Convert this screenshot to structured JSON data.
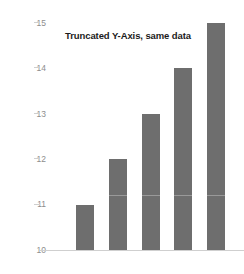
{
  "chart_data": {
    "type": "bar",
    "title": "Truncated Y-Axis, same data",
    "xlabel": "",
    "ylabel": "",
    "categories": [
      "1",
      "2",
      "3",
      "4",
      "5"
    ],
    "values": [
      11,
      12,
      13,
      14,
      15
    ],
    "ylim": [
      10,
      15
    ],
    "yticks": [
      10,
      11,
      12,
      13,
      14,
      15
    ],
    "ytick_labels": [
      "10",
      "11",
      "12",
      "13",
      "14",
      "15"
    ],
    "xtick_labels": [
      "",
      "",
      "",
      "",
      ""
    ],
    "grid": false,
    "legend": null,
    "legend_position": "none",
    "annotations": [],
    "axis_truncated": true,
    "bar_color": "#6e6e6e",
    "tick_label_color": "#8d8d8d",
    "axis_line_color": "#cfcfcf",
    "title_color": "#1b1b1b",
    "background_color": "#ffffff"
  }
}
